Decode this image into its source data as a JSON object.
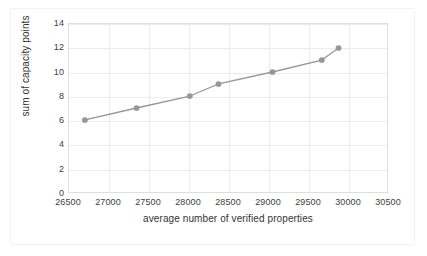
{
  "chart_data": {
    "type": "line",
    "title": "",
    "xlabel": "average number of verified properties",
    "ylabel": "sum of capacity points",
    "xlim": [
      26500,
      30500
    ],
    "ylim": [
      0,
      14
    ],
    "xticks": [
      26500,
      27000,
      27500,
      28000,
      28500,
      29000,
      29500,
      30000,
      30500
    ],
    "yticks": [
      0,
      2,
      4,
      6,
      8,
      10,
      12,
      14
    ],
    "grid": true,
    "legend": "none",
    "series": [
      {
        "name": "capacity",
        "color": "#969696",
        "marker": "circle",
        "x": [
          26700,
          27350,
          28020,
          28380,
          29060,
          29680,
          29890
        ],
        "y": [
          6.0,
          7.0,
          8.0,
          9.0,
          10.0,
          11.0,
          12.0
        ]
      }
    ]
  },
  "axes": {
    "x_tick_labels": [
      "26500",
      "27000",
      "27500",
      "28000",
      "28500",
      "29000",
      "29500",
      "30000",
      "30500"
    ],
    "y_tick_labels": [
      "0",
      "2",
      "4",
      "6",
      "8",
      "10",
      "12",
      "14"
    ],
    "x_title": "average number of verified properties",
    "y_title": "sum of capacity points"
  },
  "style": {
    "series_color": "#969696",
    "grid_color": "#ececec",
    "axis_border_color": "#dedede",
    "text_color": "#404040",
    "background": "#ffffff"
  }
}
